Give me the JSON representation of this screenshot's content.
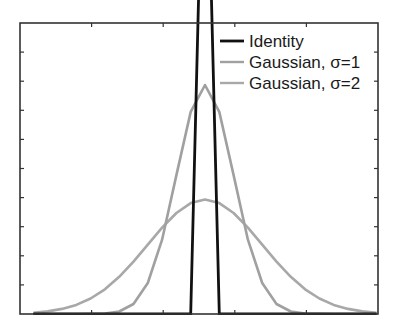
{
  "chart_data": {
    "type": "line",
    "title": "",
    "xlabel": "",
    "ylabel": "",
    "x": [
      -6,
      -5.5,
      -5,
      -4.5,
      -4,
      -3.5,
      -3,
      -2.5,
      -2,
      -1.5,
      -1,
      -0.5,
      0,
      0.5,
      1,
      1.5,
      2,
      2.5,
      3,
      3.5,
      4,
      4.5,
      5,
      5.5,
      6
    ],
    "xlim": [
      -6.47,
      6.05
    ],
    "ylim": [
      0,
      0.507
    ],
    "grid": false,
    "tick_labels_visible": false,
    "legend_position": "upper right",
    "series": [
      {
        "name": "Identity",
        "color": "#111111",
        "values": [
          0,
          0,
          0,
          0,
          0,
          0,
          0,
          0,
          0,
          0,
          0,
          0,
          1,
          0,
          0,
          0,
          0,
          0,
          0,
          0,
          0,
          0,
          0,
          0,
          0
        ]
      },
      {
        "name": "Gaussian, σ=1",
        "color": "#a0a0a0",
        "values": [
          0,
          0,
          0,
          0,
          0.0001,
          0.0009,
          0.0044,
          0.0175,
          0.054,
          0.1295,
          0.242,
          0.3521,
          0.3989,
          0.3521,
          0.242,
          0.1295,
          0.054,
          0.0175,
          0.0044,
          0.0009,
          0.0001,
          0,
          0,
          0,
          0
        ]
      },
      {
        "name": "Gaussian, σ=2",
        "color": "#a8a8a8",
        "values": [
          0.0022,
          0.0045,
          0.0088,
          0.0159,
          0.027,
          0.0431,
          0.0648,
          0.0913,
          0.121,
          0.1506,
          0.176,
          0.1933,
          0.1995,
          0.1933,
          0.176,
          0.1506,
          0.121,
          0.0913,
          0.0648,
          0.0431,
          0.027,
          0.0159,
          0.0088,
          0.0045,
          0.0022
        ]
      }
    ]
  },
  "legend": {
    "items": [
      {
        "label": "Identity",
        "color": "#111111"
      },
      {
        "label": "Gaussian, σ=1",
        "color": "#a0a0a0"
      },
      {
        "label": "Gaussian, σ=2",
        "color": "#a8a8a8"
      }
    ]
  }
}
